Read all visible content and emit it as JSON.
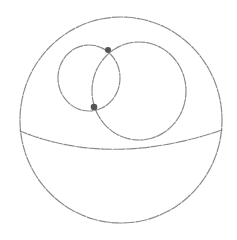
{
  "diagram": {
    "type": "sphere-with-intersecting-circles",
    "colors": {
      "stroke": "#8a8a8a",
      "point": "#555555",
      "background": "#ffffff"
    },
    "sphere": {
      "cx": 121,
      "cy": 120,
      "rx": 101,
      "ry": 103
    },
    "equator": {
      "path": "M 20 131 Q 110 168 222 130"
    },
    "circles": [
      {
        "name": "small-circle",
        "cx": 89,
        "cy": 78,
        "rx": 31,
        "ry": 33
      },
      {
        "name": "large-circle",
        "cx": 139,
        "cy": 91,
        "rx": 47,
        "ry": 49
      }
    ],
    "points": [
      {
        "name": "intersection-point-top",
        "x": 108,
        "y": 50,
        "r": 3
      },
      {
        "name": "intersection-point-bottom",
        "x": 94,
        "y": 107,
        "r": 3.3
      }
    ]
  }
}
